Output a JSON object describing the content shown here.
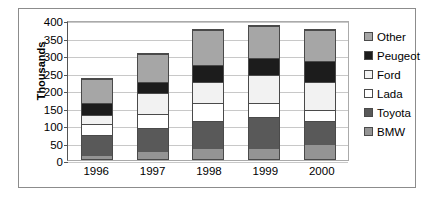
{
  "chart_data": {
    "type": "bar",
    "stacked": true,
    "title": "",
    "xlabel": "",
    "ylabel": "Thousands",
    "ylim": [
      0,
      400
    ],
    "ytick_step": 50,
    "yticks": [
      400,
      350,
      300,
      250,
      200,
      150,
      100,
      50,
      0
    ],
    "grid": true,
    "legend_position": "right",
    "categories": [
      "1996",
      "1997",
      "1998",
      "1999",
      "2000"
    ],
    "series": [
      {
        "name": "BMW",
        "color": "#949494",
        "values": [
          10,
          20,
          30,
          30,
          40
        ]
      },
      {
        "name": "Toyota",
        "color": "#595959",
        "values": [
          60,
          70,
          80,
          90,
          70
        ]
      },
      {
        "name": "Lada",
        "color": "#ffffff",
        "values": [
          30,
          40,
          50,
          40,
          30
        ]
      },
      {
        "name": "Ford",
        "color": "#f2f2f2",
        "values": [
          25,
          60,
          60,
          80,
          80
        ]
      },
      {
        "name": "Peugeot",
        "color": "#1c1c1c",
        "values": [
          35,
          30,
          50,
          50,
          60
        ]
      },
      {
        "name": "Other",
        "color": "#a6a6a6",
        "values": [
          70,
          80,
          100,
          90,
          90
        ]
      }
    ],
    "totals": [
      230,
      300,
      370,
      380,
      370
    ],
    "legend_order": [
      "Other",
      "Peugeot",
      "Ford",
      "Lada",
      "Toyota",
      "BMW"
    ]
  }
}
